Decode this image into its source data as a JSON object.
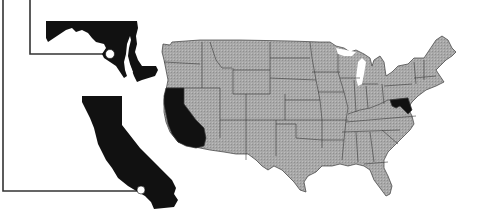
{
  "map": {
    "title": "",
    "region": "United States (contiguous)",
    "highlighted_states": [
      "California",
      "Maryland"
    ],
    "colors": {
      "base_state_fill": "#a8a8a8",
      "highlight_fill": "#111111",
      "border": "#3a3a3a",
      "background": "#ffffff",
      "callout_line": "#333333",
      "callout_dot": "#ffffff"
    },
    "insets": [
      {
        "state": "Maryland",
        "callout": "line from left margin to city marker"
      },
      {
        "state": "California",
        "callout": "line from left margin to city marker"
      }
    ]
  }
}
